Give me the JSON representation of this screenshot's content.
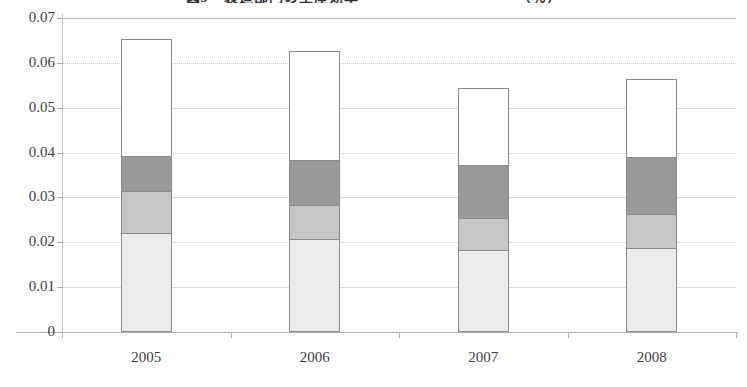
{
  "chart_data": {
    "type": "bar",
    "subtype": "stacked-column",
    "title": "図3　製造部門の生産効率　　　　　　　　　　　（％）",
    "xlabel": "",
    "ylabel": "",
    "categories": [
      "2005",
      "2006",
      "2007",
      "2008"
    ],
    "ylim": [
      0,
      0.07
    ],
    "ytick_labels": [
      "0.07",
      "0.06",
      "0.05",
      "0.04",
      "0.03",
      "0.02",
      "0.01",
      "0"
    ],
    "ytick_values": [
      0.07,
      0.06,
      0.05,
      0.04,
      0.03,
      0.02,
      0.01,
      0
    ],
    "grid": true,
    "legend": "none",
    "series": [
      {
        "name": "series-1-light-gray",
        "color": "#ececec",
        "values": [
          0.0219,
          0.0206,
          0.018,
          0.0185
        ]
      },
      {
        "name": "series-2-medium-gray",
        "color": "#c6c6c6",
        "values": [
          0.0094,
          0.0076,
          0.0072,
          0.0075
        ]
      },
      {
        "name": "series-3-dark-gray",
        "color": "#9a9a9a",
        "values": [
          0.0077,
          0.0099,
          0.0119,
          0.0128
        ]
      },
      {
        "name": "series-4-white",
        "color": "#ffffff",
        "values": [
          0.0262,
          0.0244,
          0.017,
          0.0173
        ]
      }
    ],
    "cumulative_tops": [
      [
        0.0219,
        0.0313,
        0.039,
        0.0652
      ],
      [
        0.0206,
        0.0282,
        0.0381,
        0.0625
      ],
      [
        0.018,
        0.0252,
        0.0371,
        0.0541
      ],
      [
        0.0185,
        0.026,
        0.0388,
        0.0561
      ]
    ],
    "totals": [
      0.0652,
      0.0625,
      0.0541,
      0.0561
    ]
  },
  "axis": {
    "y_labels": [
      "0.07",
      "0.06",
      "0.05",
      "0.04",
      "0.03",
      "0.02",
      "0.01",
      "0"
    ],
    "x_labels": [
      "2005",
      "2006",
      "2007",
      "2008"
    ]
  }
}
